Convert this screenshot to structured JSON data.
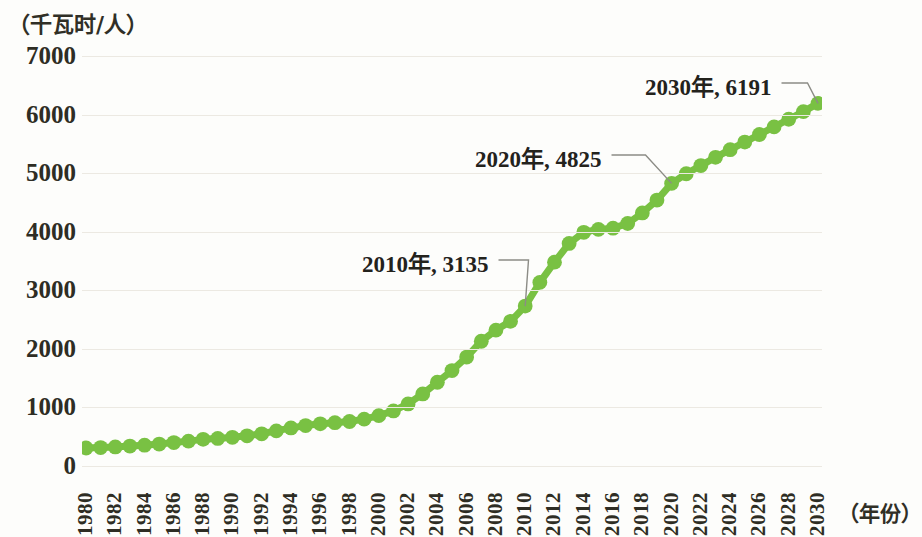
{
  "chart_data": {
    "type": "line",
    "title": "",
    "subtitle": "",
    "ylabel": "（千瓦时/人）",
    "xlabel": "（年份）",
    "ylim": [
      0,
      7000
    ],
    "xlim": [
      1980,
      2030
    ],
    "grid": true,
    "legend": "none",
    "series_color": "#79c143",
    "marker": "circle",
    "y_ticks": [
      7000,
      6000,
      5000,
      4000,
      3000,
      2000,
      1000,
      0
    ],
    "y_tick_labels": [
      "7000",
      "6000",
      "5000",
      "4000",
      "3000",
      "2000",
      "1000",
      "0"
    ],
    "x_tick_labels": [
      "1980",
      "1982",
      "1984",
      "1986",
      "1988",
      "1990",
      "1992",
      "1994",
      "1996",
      "1998",
      "2000",
      "2002",
      "2004",
      "2006",
      "2008",
      "2010",
      "2012",
      "2014",
      "2016",
      "2018",
      "2020",
      "2022",
      "2024",
      "2026",
      "2028",
      "2030"
    ],
    "x": [
      1980,
      1981,
      1982,
      1983,
      1984,
      1985,
      1986,
      1987,
      1988,
      1989,
      1990,
      1991,
      1992,
      1993,
      1994,
      1995,
      1996,
      1997,
      1998,
      1999,
      2000,
      2001,
      2002,
      2003,
      2004,
      2005,
      2006,
      2007,
      2008,
      2009,
      2010,
      2011,
      2012,
      2013,
      2014,
      2015,
      2016,
      2017,
      2018,
      2019,
      2020,
      2021,
      2022,
      2023,
      2024,
      2025,
      2026,
      2027,
      2028,
      2029,
      2030
    ],
    "values": [
      307,
      315,
      325,
      340,
      355,
      375,
      400,
      425,
      455,
      470,
      490,
      515,
      550,
      600,
      650,
      690,
      720,
      740,
      760,
      800,
      860,
      940,
      1060,
      1230,
      1430,
      1630,
      1860,
      2130,
      2320,
      2470,
      2730,
      3135,
      3480,
      3800,
      3990,
      4040,
      4060,
      4140,
      4320,
      4540,
      4825,
      4990,
      5130,
      5270,
      5400,
      5530,
      5660,
      5790,
      5920,
      6050,
      6191
    ],
    "annotations": [
      {
        "label": "2010年, 3135",
        "year": 2010,
        "value": 3135
      },
      {
        "label": "2020年, 4825",
        "year": 2020,
        "value": 4825
      },
      {
        "label": "2030年, 6191",
        "year": 2030,
        "value": 6191
      }
    ]
  }
}
